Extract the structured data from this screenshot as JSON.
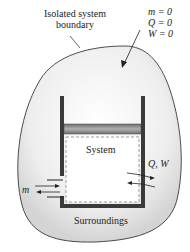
{
  "labels": {
    "boundary_line1": "Isolated system",
    "boundary_line2": "boundary",
    "m_eq": "m = 0",
    "q_eq": "Q = 0",
    "w_eq": "W = 0",
    "system": "System",
    "surroundings": "Surroundings",
    "qw": "Q, W",
    "m": "m"
  },
  "colors": {
    "blob_fill": "#ececec",
    "blob_edge": "#c8c8c8",
    "container": "#3a3a3a",
    "piston": "#8a8a8a"
  }
}
